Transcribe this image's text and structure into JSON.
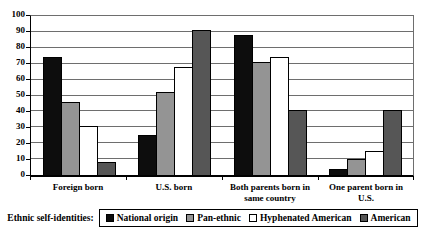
{
  "chart_data": {
    "type": "bar",
    "title": "",
    "xlabel": "",
    "ylabel": "",
    "categories": [
      "Foreign born",
      "U.S. born",
      "Both parents born in same country",
      "One parent born in U.S."
    ],
    "series": [
      {
        "name": "National origin",
        "color": "#0d0d0d",
        "values": [
          74,
          25,
          88,
          4
        ]
      },
      {
        "name": "Pan-ethnic",
        "color": "#949494",
        "values": [
          46,
          52,
          71,
          10
        ]
      },
      {
        "name": "Hyphenated American",
        "color": "#ffffff",
        "values": [
          31,
          68,
          74,
          15
        ]
      },
      {
        "name": "American",
        "color": "#565656",
        "values": [
          8,
          91,
          41,
          41
        ]
      }
    ],
    "ylim": [
      0,
      100
    ],
    "yticks": [
      0,
      10,
      20,
      30,
      40,
      50,
      60,
      70,
      80,
      90,
      100
    ],
    "grid": true,
    "legend_position": "bottom"
  },
  "legend": {
    "prefix_label": "Ethnic self-identities:"
  },
  "colors": {
    "background": "#ffffff",
    "gridline": "#6e6e6e",
    "axis": "#000000"
  }
}
